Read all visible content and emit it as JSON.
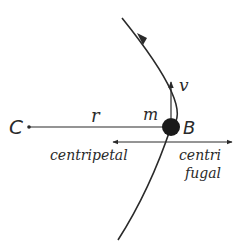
{
  "diagram": {
    "title": "",
    "colors": {
      "ink": "#2a2a2a",
      "background": "#ffffff"
    },
    "labels": {
      "center": "C",
      "radius": "r",
      "mass": "m",
      "body": "B",
      "velocity": "v",
      "centripetal": "centripetal",
      "centrifugal_line1": "centri",
      "centrifugal_line2": "fugal"
    },
    "elements": {
      "orbit_arc": "circular path of body around center C, arrow indicating counter-clockwise motion",
      "radius_line": "line from C to B",
      "body": "filled circle at B",
      "velocity_arrow": "tangent arrow at B pointing upward",
      "force_arrows": "double-headed horizontal arrow: left = centripetal, right = centrifugal"
    }
  }
}
